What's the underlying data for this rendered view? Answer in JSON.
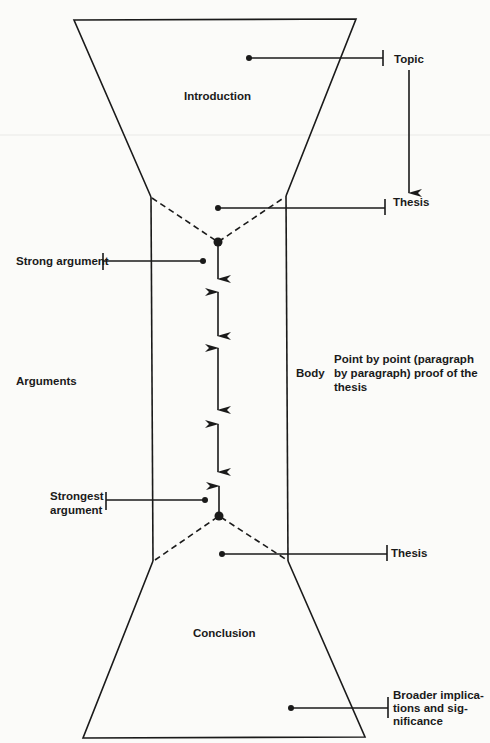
{
  "diagram": {
    "type": "essay-structure-hourglass",
    "sections": {
      "introduction": "Introduction",
      "body": "Body",
      "conclusion": "Conclusion"
    },
    "labels": {
      "topic": "Topic",
      "thesis_top": "Thesis",
      "thesis_bottom": "Thesis",
      "strong_argument": "Strong argument",
      "arguments": "Arguments",
      "strongest_argument_line1": "Strongest",
      "strongest_argument_line2": "argument",
      "body_desc_line1": "Point by point (paragraph",
      "body_desc_line2": "by paragraph) proof of the",
      "body_desc_line3": "thesis",
      "broader_line1": "Broader implica-",
      "broader_line2": "tions and sig-",
      "broader_line3": "nificance"
    },
    "colors": {
      "ink": "#1a1a1a",
      "paper": "#fbfbf9"
    }
  }
}
